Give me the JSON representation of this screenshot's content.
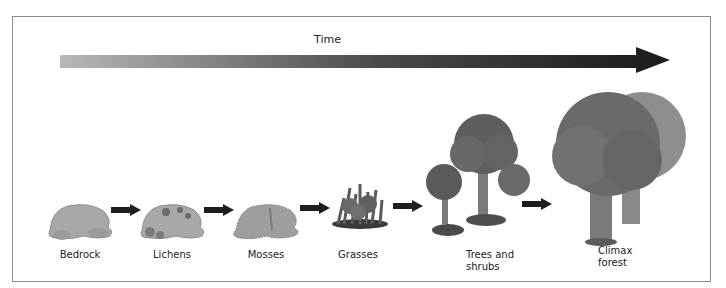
{
  "diagram": {
    "type": "ecological-succession",
    "time_axis": {
      "label": "Time",
      "direction": "left-to-right",
      "gradient": [
        "#b8b8b8",
        "#1e1e1e"
      ]
    },
    "stages": [
      {
        "id": "bedrock",
        "label": "Bedrock",
        "icon": "bare-rock-icon"
      },
      {
        "id": "lichens",
        "label": "Lichens",
        "icon": "rock-with-lichens-icon"
      },
      {
        "id": "mosses",
        "label": "Mosses",
        "icon": "mossy-rock-icon"
      },
      {
        "id": "grasses",
        "label": "Grasses",
        "icon": "grass-clump-icon"
      },
      {
        "id": "trees_shrubs",
        "label_line1": "Trees and",
        "label_line2": "shrubs",
        "icon": "small-trees-shrubs-icon"
      },
      {
        "id": "climax_forest",
        "label_line1": "Climax",
        "label_line2": "forest",
        "icon": "large-trees-icon"
      }
    ],
    "connector": "right-arrow",
    "colors": {
      "border": "#8a8a8a",
      "arrow": "#1e1e1e",
      "rock": "#a8a8a8",
      "foliage": "#5e5e5e",
      "trunk": "#7a7a7a"
    }
  }
}
